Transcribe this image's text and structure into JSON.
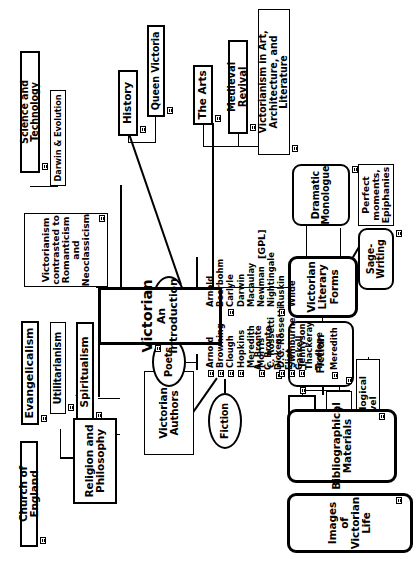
{
  "diagram": {
    "title": "Victorian An Introduction",
    "credit": "[GPL]",
    "icon_name": "page-marker-icon"
  },
  "center": {
    "line1": "Victorian",
    "line2": "An Introduction"
  },
  "religion": {
    "hub": "Religion and\nPhilosophy",
    "church": "Church of England",
    "evangelicalism": "Evangelicalism",
    "utilitarianism": "Utilitarianism",
    "spiritualism": "Spiritualism"
  },
  "authors": {
    "hub": "Victorian\nAuthors",
    "fiction": "Fiction",
    "poets": "Poets",
    "prose": "Prose",
    "fiction_list": [
      {
        "name": "A. Bronte",
        "icon": false
      },
      {
        "name": "C. Bronte",
        "icon": false
      },
      {
        "name": "Dickens",
        "icon": true
      },
      {
        "name": "Eliot",
        "icon": false
      },
      {
        "name": "Gaskell",
        "icon": false
      },
      {
        "name": "Thackeray",
        "icon": false
      },
      {
        "name": "Trollope",
        "icon": false
      }
    ],
    "fiction_extra": [
      {
        "name": "Meredith",
        "icon": true
      }
    ],
    "poets_list": [
      {
        "name": "Arnold",
        "icon": true
      },
      {
        "name": "Browning",
        "icon": true
      },
      {
        "name": "Clough",
        "icon": true
      },
      {
        "name": "Hopkins",
        "icon": true
      },
      {
        "name": "Meredith",
        "icon": false
      },
      {
        "name": "Morris",
        "icon": true
      },
      {
        "name": "C. Rossetti",
        "icon": false
      },
      {
        "name": "D.G. Rossetti",
        "icon": true
      },
      {
        "name": "Swinburne",
        "icon": true
      },
      {
        "name": "Tennyson",
        "icon": true
      }
    ],
    "prose_list": [
      {
        "name": "Arnold",
        "icon": false
      },
      {
        "name": "Beerbohm",
        "icon": false
      },
      {
        "name": "Carlyle",
        "icon": true
      },
      {
        "name": "Darwin",
        "icon": false
      },
      {
        "name": "Macaulay",
        "icon": false
      },
      {
        "name": "Newman",
        "icon": false
      },
      {
        "name": "Nightingale",
        "icon": false
      },
      {
        "name": "Ruskin",
        "icon": true
      },
      {
        "name": "Wilde",
        "icon": false
      }
    ]
  },
  "context": {
    "contrast": "Victorianism\ncontrasted to\nRomanticism\nand\nNeoclassicism",
    "science": "Science and Technology",
    "darwin": "Darwin & Evolution",
    "history": "History",
    "queen": "Queen Victoria",
    "arts": "The Arts",
    "medieval": "Medieval Revival",
    "art_arch": "Victorianism in Art,\nArchitecture, and Literature"
  },
  "forms": {
    "hub": "Victorian\nLiterary Forms",
    "dramatic": "Dramatic\nMonologue",
    "epiphanies": "Perfect moments,\nEpiphanies",
    "sage": "Sage-Writing",
    "fiction": "Fiction",
    "realist": "Realist Novel",
    "fantasy": "Fantasy",
    "psych": "Psychological Novel"
  },
  "resources": {
    "biblio": "Bibliographical\nMaterials",
    "images": "Images of Victorian\nLife"
  }
}
